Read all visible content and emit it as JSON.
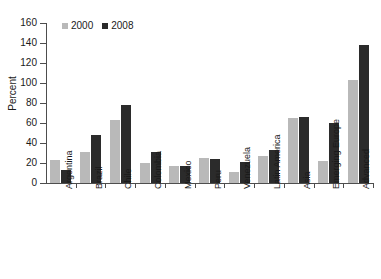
{
  "chart_data": {
    "type": "bar",
    "title": "",
    "xlabel": "",
    "ylabel": "Percent",
    "ylim": [
      0,
      160
    ],
    "yticks": [
      0,
      20,
      40,
      60,
      80,
      100,
      120,
      140,
      160
    ],
    "grid": false,
    "legend_position": "top-left",
    "categories": [
      "Argentina",
      "Brazil",
      "Chile",
      "Colombia",
      "Mexico",
      "Peru",
      "Venezuela",
      "Latin America",
      "Asia",
      "Emerging Europe",
      "Advanced"
    ],
    "series": [
      {
        "name": "2000",
        "color": "#b9b9b9",
        "values": [
          23,
          31,
          63,
          20,
          17,
          25,
          11,
          27,
          65,
          22,
          103
        ]
      },
      {
        "name": "2008",
        "color": "#2b2b2b",
        "values": [
          13,
          48,
          78,
          31,
          17,
          24,
          21,
          33,
          66,
          60,
          138
        ]
      }
    ]
  },
  "legend": {
    "entries": [
      {
        "label": "2000"
      },
      {
        "label": "2008"
      }
    ]
  },
  "colors": {
    "series_2000": "#b9b9b9",
    "series_2008": "#2b2b2b",
    "axis": "#4d4d4d",
    "text": "#1a1a1a",
    "background": "#ffffff"
  }
}
